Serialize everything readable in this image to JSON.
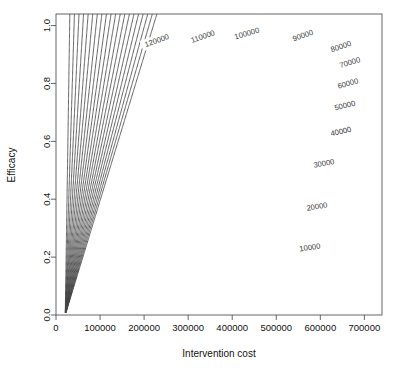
{
  "chart_data": {
    "type": "line",
    "subtype": "contour",
    "title": "",
    "xlabel": "Intervention cost",
    "ylabel": "Efficacy",
    "xlim": [
      0,
      740000
    ],
    "ylim": [
      0.0,
      1.04
    ],
    "xticks": [
      0,
      100000,
      200000,
      300000,
      400000,
      500000,
      600000,
      700000
    ],
    "xtick_labels": [
      "0",
      "100000",
      "200000",
      "300000",
      "400000",
      "500000",
      "600000",
      "700000"
    ],
    "yticks": [
      0.0,
      0.2,
      0.4,
      0.6,
      0.8,
      1.0
    ],
    "ytick_labels": [
      "0.0",
      "0.2",
      "0.4",
      "0.6",
      "0.8",
      "1.0"
    ],
    "grid": false,
    "legend": "none",
    "contour_model": {
      "formula": "z = (cost - cost_offset) / efficacy",
      "cost_offset": 21000
    },
    "levels": [
      10000,
      20000,
      30000,
      40000,
      50000,
      60000,
      70000,
      80000,
      90000,
      100000,
      110000,
      120000,
      130000,
      140000,
      150000,
      160000,
      170000,
      180000,
      190000,
      200000
    ],
    "labeled_levels": [
      {
        "value": 10000,
        "label": "10000",
        "label_x": 310,
        "label_y": 248,
        "rotation": -8
      },
      {
        "value": 20000,
        "label": "20000",
        "label_x": 317,
        "label_y": 207,
        "rotation": -9
      },
      {
        "value": 30000,
        "label": "30000",
        "label_x": 324,
        "label_y": 164,
        "rotation": -10
      },
      {
        "value": 40000,
        "label": "40000",
        "label_x": 341,
        "label_y": 132,
        "rotation": -13
      },
      {
        "value": 50000,
        "label": "50000",
        "label_x": 345,
        "label_y": 106,
        "rotation": -14
      },
      {
        "value": 60000,
        "label": "60000",
        "label_x": 348,
        "label_y": 84,
        "rotation": -16
      },
      {
        "value": 70000,
        "label": "70000",
        "label_x": 350,
        "label_y": 63,
        "rotation": -17
      },
      {
        "value": 80000,
        "label": "80000",
        "label_x": 341,
        "label_y": 47,
        "rotation": -19
      },
      {
        "value": 90000,
        "label": "90000",
        "label_x": 303,
        "label_y": 36,
        "rotation": -20
      },
      {
        "value": 100000,
        "label": "100000",
        "label_x": 247,
        "label_y": 34,
        "rotation": -16
      },
      {
        "value": 110000,
        "label": "110000",
        "label_x": 203,
        "label_y": 37,
        "rotation": -19
      },
      {
        "value": 120000,
        "label": "120000",
        "label_x": 157,
        "label_y": 41,
        "rotation": -20
      }
    ]
  },
  "axes": {
    "x_title": "Intervention cost",
    "y_title": "Efficacy"
  },
  "colors": {
    "background": "#ffffff",
    "contour_line": "#444444",
    "frame": "#555555",
    "text": "#111111",
    "contour_label": "#3a3a3a"
  }
}
